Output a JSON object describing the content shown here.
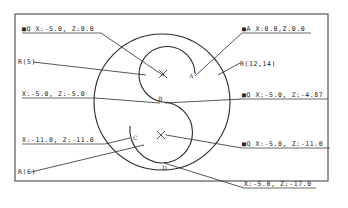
{
  "diagram": {
    "type": "lathe-profile-coordinate-annotation",
    "labels": {
      "start_point": "■Q X:-5.0, Z:0.0",
      "origin_a": "■A X:0.0,Z:0.0",
      "r5_left": "R(5)",
      "r12_14": "R(12,14)",
      "b_point": "X:-5.0, Z:-5.0",
      "tangent_right": "■Q X:-5.0, Z:-4.87",
      "c_point": "X:-11.0, Z:-11.0",
      "center_lower": "■Q X:-5.0, Z:-11.0",
      "r6_left": "R(6)",
      "d_point": "X:-5.0, Z:-17.0"
    },
    "points": {
      "A": "A",
      "B": "B",
      "C": "C",
      "D": "D"
    },
    "colors": {
      "line": "#2a2a2a",
      "frame": "#555555",
      "background": "#ffffff"
    }
  }
}
